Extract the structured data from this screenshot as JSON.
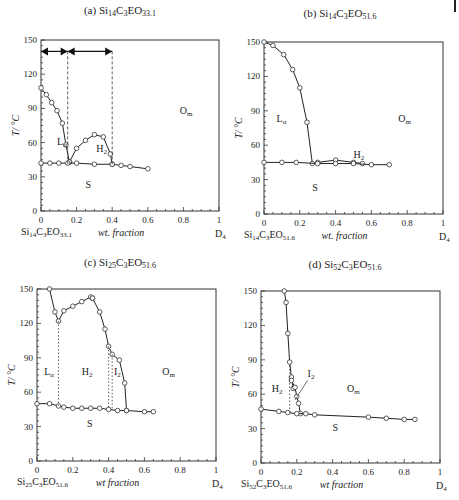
{
  "figure": {
    "panels": [
      {
        "id": "a",
        "title_prefix": "(a) ",
        "comp": "Si14C3EO33.1",
        "title_main": "Si",
        "s1": "14",
        "c": "C",
        "s2": "3",
        "eo": "EO",
        "s3": "33.1",
        "ylabel": "T/ °C",
        "xlabel": "wt. fraction",
        "xleft": "Si14C3EO33.1",
        "xright": "D",
        "xright_sub": "4",
        "regions": {
          "La": "L",
          "La_sub": "α",
          "H2": "H",
          "H2_sub": "2",
          "Om": "O",
          "Om_sub": "m",
          "S": "S"
        }
      },
      {
        "id": "b",
        "title_prefix": "(b) ",
        "title_main": "Si",
        "s1": "14",
        "c": "C",
        "s2": "3",
        "eo": "EO",
        "s3": "51.6",
        "ylabel": "T/ °C",
        "xlabel": "wt. fraction",
        "xright": "D",
        "xright_sub": "4",
        "regions": {
          "La": "L",
          "La_sub": "α",
          "H2": "H",
          "H2_sub": "2",
          "Om": "O",
          "Om_sub": "m",
          "S": "S"
        }
      },
      {
        "id": "c",
        "title_prefix": "(c) ",
        "title_main": "Si",
        "s1": "25",
        "c": "C",
        "s2": "3",
        "eo": "EO",
        "s3": "51.6",
        "ylabel": "T/ °C",
        "xlabel": "wt fraction",
        "xright": "D",
        "xright_sub": "4",
        "regions": {
          "La": "L",
          "La_sub": "α",
          "H2": "H",
          "H2_sub": "2",
          "I2": "I",
          "I2_sub": "2",
          "Om": "O",
          "Om_sub": "m",
          "S": "S"
        }
      },
      {
        "id": "d",
        "title_prefix": "(d) ",
        "title_main": "Si",
        "s1": "52",
        "c": "C",
        "s2": "3",
        "eo": "EO",
        "s3": "51.6",
        "ylabel": "T/ °C",
        "xlabel": "wt fraction",
        "xright": "D",
        "xright_sub": "4",
        "regions": {
          "H2": "H",
          "H2_sub": "2",
          "I2": "I",
          "I2_sub": "2",
          "Om": "O",
          "Om_sub": "m",
          "S": "S"
        }
      }
    ],
    "xticks": [
      "0",
      "0.2",
      "0.4",
      "0.6",
      "0.8",
      "1"
    ],
    "yticks": [
      "0",
      "30",
      "60",
      "90",
      "120",
      "150"
    ]
  },
  "chart_data": [
    {
      "type": "line",
      "title": "(a) Si14C3EO33.1",
      "xlabel": "wt. fraction (Si14C3EO33.1 → D4)",
      "ylabel": "T / °C",
      "xlim": [
        0,
        1
      ],
      "ylim": [
        0,
        150
      ],
      "series": [
        {
          "name": "Lα boundary",
          "x": [
            0,
            0.03,
            0.06,
            0.09,
            0.12,
            0.14,
            0.16
          ],
          "y": [
            108,
            102,
            95,
            88,
            77,
            58,
            43
          ]
        },
        {
          "name": "H2 boundary",
          "x": [
            0.16,
            0.2,
            0.25,
            0.3,
            0.35,
            0.39,
            0.4
          ],
          "y": [
            43,
            55,
            62,
            67,
            65,
            50,
            41
          ]
        },
        {
          "name": "Solid (S) boundary",
          "x": [
            0,
            0.05,
            0.1,
            0.15,
            0.2,
            0.3,
            0.4,
            0.45,
            0.5,
            0.6
          ],
          "y": [
            42,
            42,
            42,
            42,
            42,
            41,
            41,
            40,
            39,
            37
          ]
        }
      ],
      "annotations": [
        "Lα",
        "H2",
        "Om",
        "S",
        "arrows at T=140: 0–0.15 and 0.15–0.4"
      ]
    },
    {
      "type": "line",
      "title": "(b) Si14C3EO51.6",
      "xlabel": "wt. fraction (Si14C3EO51.6 → D4)",
      "ylabel": "T / °C",
      "xlim": [
        0,
        1
      ],
      "ylim": [
        0,
        150
      ],
      "series": [
        {
          "name": "Lα boundary",
          "x": [
            0,
            0.05,
            0.11,
            0.16,
            0.2,
            0.24,
            0.27
          ],
          "y": [
            150,
            147,
            139,
            126,
            110,
            80,
            44
          ]
        },
        {
          "name": "H2 boundary",
          "x": [
            0.3,
            0.4,
            0.5,
            0.55
          ],
          "y": [
            45,
            47,
            45,
            44
          ]
        },
        {
          "name": "Solid (S) boundary",
          "x": [
            0,
            0.1,
            0.18,
            0.3,
            0.4,
            0.5,
            0.6,
            0.7
          ],
          "y": [
            45,
            45,
            45,
            44,
            44,
            44,
            43,
            43
          ]
        }
      ],
      "annotations": [
        "Lα",
        "H2",
        "Om",
        "S"
      ]
    },
    {
      "type": "line",
      "title": "(c) Si25C3EO51.6",
      "xlabel": "wt fraction (Si25C3EO51.6 → D4)",
      "ylabel": "T / °C",
      "xlim": [
        0,
        1
      ],
      "ylim": [
        0,
        150
      ],
      "series": [
        {
          "name": "Lα/H2 boundary",
          "x": [
            0.07,
            0.1,
            0.12,
            0.15,
            0.2,
            0.25,
            0.3,
            0.31
          ],
          "y": [
            150,
            130,
            122,
            131,
            135,
            139,
            143,
            142
          ]
        },
        {
          "name": "H2/I2 boundary",
          "x": [
            0.31,
            0.35,
            0.38,
            0.4,
            0.42,
            0.46,
            0.49,
            0.5
          ],
          "y": [
            142,
            130,
            115,
            100,
            93,
            88,
            68,
            44
          ]
        },
        {
          "name": "Solid (S) boundary",
          "x": [
            0,
            0.07,
            0.12,
            0.15,
            0.2,
            0.25,
            0.3,
            0.35,
            0.4,
            0.45,
            0.5,
            0.6,
            0.65
          ],
          "y": [
            50,
            50,
            48,
            47,
            46,
            46,
            46,
            46,
            45,
            44,
            44,
            43,
            43
          ]
        }
      ],
      "annotations": [
        "Lα",
        "H2",
        "I2",
        "Om",
        "S"
      ]
    },
    {
      "type": "line",
      "title": "(d) Si52C3EO51.6",
      "xlabel": "wt fraction (Si52C3EO51.6 → D4)",
      "ylabel": "T / °C",
      "xlim": [
        0,
        1
      ],
      "ylim": [
        0,
        150
      ],
      "series": [
        {
          "name": "H2 boundary",
          "x": [
            0.13,
            0.14,
            0.15,
            0.16,
            0.17,
            0.18
          ],
          "y": [
            150,
            140,
            113,
            88,
            75,
            65
          ]
        },
        {
          "name": "I2 boundary",
          "x": [
            0.17,
            0.19,
            0.2,
            0.21,
            0.22
          ],
          "y": [
            72,
            66,
            58,
            52,
            43
          ]
        },
        {
          "name": "Solid (S) boundary",
          "x": [
            0,
            0.1,
            0.15,
            0.2,
            0.25,
            0.3,
            0.6,
            0.7,
            0.8,
            0.86
          ],
          "y": [
            47,
            45,
            44,
            43,
            43,
            42,
            40,
            39,
            38,
            38
          ]
        }
      ],
      "annotations": [
        "H2",
        "I2",
        "Om",
        "S"
      ]
    }
  ]
}
